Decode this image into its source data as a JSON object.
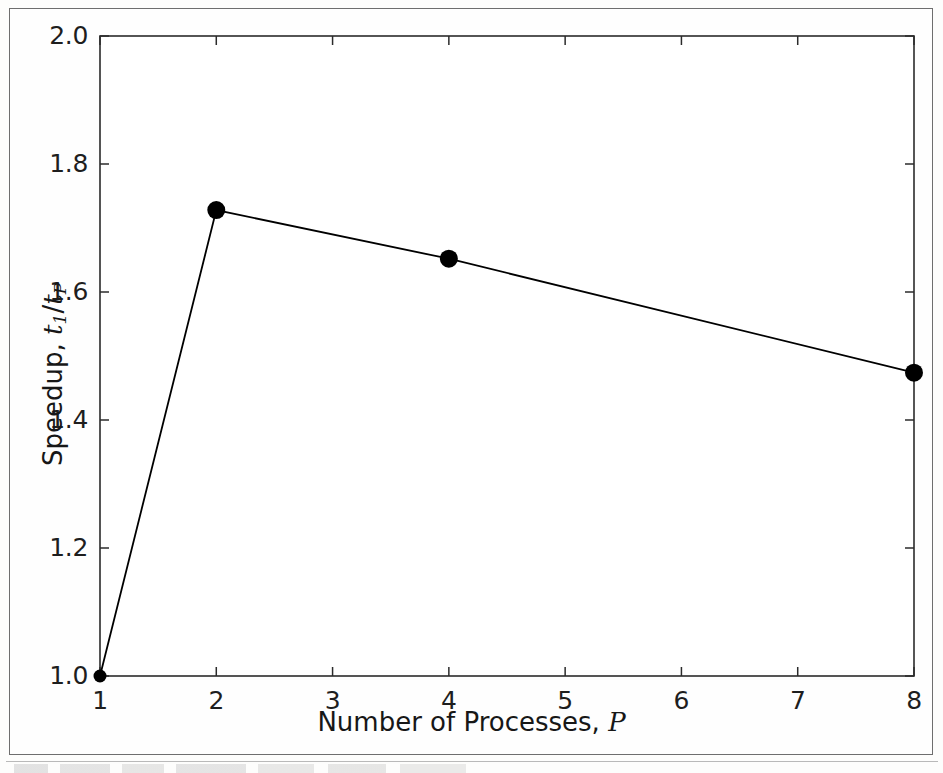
{
  "figure": {
    "background_color": "#fdfdfc",
    "frame_color": "#6e6e6e",
    "ink_color": "#1a1a1a"
  },
  "axes": {
    "x_title_prefix": "Number of Processes,",
    "x_title_var": "P",
    "y_title_prefix": "Speedup,",
    "y_title_num_var": "t",
    "y_title_num_sub": "1",
    "y_title_slash": "/",
    "y_title_den_var": "t",
    "y_title_den_sub": "P",
    "x_tick_labels": [
      "1",
      "2",
      "3",
      "4",
      "5",
      "6",
      "7",
      "8"
    ],
    "y_tick_labels": [
      "1.0",
      "1.2",
      "1.4",
      "1.6",
      "1.8",
      "2.0"
    ]
  },
  "chart_data": {
    "type": "line",
    "title": "",
    "xlabel": "Number of Processes, P",
    "ylabel": "Speedup, t_1/t_P",
    "xlim": [
      1,
      8
    ],
    "ylim": [
      1.0,
      2.0
    ],
    "xticks": [
      1,
      2,
      3,
      4,
      5,
      6,
      7,
      8
    ],
    "yticks": [
      1.0,
      1.2,
      1.4,
      1.6,
      1.8,
      2.0
    ],
    "grid": false,
    "legend": null,
    "marker": "circle",
    "marker_color": "#000000",
    "line_color": "#000000",
    "line_width": 1.6,
    "x": [
      1,
      2,
      4,
      8
    ],
    "values": [
      1.0,
      1.728,
      1.652,
      1.474
    ],
    "series": [
      {
        "name": "speedup",
        "points": [
          {
            "x": 1,
            "y": 1.0
          },
          {
            "x": 2,
            "y": 1.728
          },
          {
            "x": 4,
            "y": 1.652
          },
          {
            "x": 8,
            "y": 1.474
          }
        ]
      }
    ]
  }
}
